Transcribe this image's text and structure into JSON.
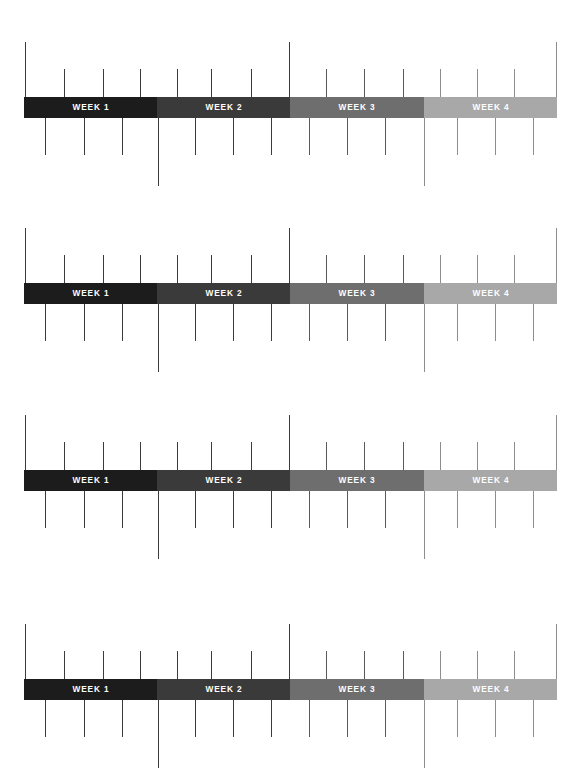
{
  "document": {
    "title": "Weekly Milestone Timeline Infographic",
    "type": "four-row week timeline with milestone leader lines",
    "background_color": "#ffffff",
    "width": 587,
    "height": 784
  },
  "week_labels": {
    "week_1": "WEEK 1",
    "week_2": "WEEK 2",
    "week_3": "WEEK 3",
    "week_4": "WEEK 4"
  },
  "palette": {
    "week_1": "#1c1c1c",
    "week_2": "#3a3a3a",
    "week_3": "#6e6e6e",
    "week_4": "#a8a8a8",
    "tick_dark": "#3b3b3b",
    "tick_mid": "#5a5a5a",
    "tick_light": "#8d8d8d",
    "label_text": "#ffffff"
  },
  "bar_geometry": {
    "left": 24,
    "width": 533,
    "height": 21,
    "segment_width": 133.25,
    "boundaries_x": [
      24,
      157,
      290,
      424,
      557
    ]
  },
  "segments": [
    {
      "key": "week_1",
      "label": "WEEK 1",
      "color": "#1c1c1c",
      "width": 133
    },
    {
      "key": "week_2",
      "label": "WEEK 2",
      "color": "#3a3a3a",
      "width": 133
    },
    {
      "key": "week_3",
      "label": "WEEK 3",
      "color": "#6e6e6e",
      "width": 134
    },
    {
      "key": "week_4",
      "label": "WEEK 4",
      "color": "#a8a8a8",
      "width": 133
    }
  ],
  "rows": [
    {
      "index": 1,
      "bar_top": 97
    },
    {
      "index": 2,
      "bar_top": 283
    },
    {
      "index": 3,
      "bar_top": 470
    },
    {
      "index": 4,
      "bar_top": 679
    }
  ],
  "ticks_above": [
    {
      "x": 25,
      "length": 55,
      "tone": "dark",
      "anchor": "row-start"
    },
    {
      "x": 64,
      "length": 28,
      "tone": "dark",
      "anchor": "milestone"
    },
    {
      "x": 103,
      "length": 28,
      "tone": "dark",
      "anchor": "milestone"
    },
    {
      "x": 140,
      "length": 28,
      "tone": "dark",
      "anchor": "milestone"
    },
    {
      "x": 177,
      "length": 28,
      "tone": "dark",
      "anchor": "milestone"
    },
    {
      "x": 211,
      "length": 28,
      "tone": "dark",
      "anchor": "milestone"
    },
    {
      "x": 251,
      "length": 28,
      "tone": "dark",
      "anchor": "milestone"
    },
    {
      "x": 289,
      "length": 55,
      "tone": "dark",
      "anchor": "week2-week3-boundary"
    },
    {
      "x": 326,
      "length": 28,
      "tone": "mid",
      "anchor": "milestone"
    },
    {
      "x": 364,
      "length": 28,
      "tone": "mid",
      "anchor": "milestone"
    },
    {
      "x": 403,
      "length": 28,
      "tone": "mid",
      "anchor": "milestone"
    },
    {
      "x": 440,
      "length": 28,
      "tone": "light",
      "anchor": "milestone"
    },
    {
      "x": 477,
      "length": 28,
      "tone": "light",
      "anchor": "milestone"
    },
    {
      "x": 514,
      "length": 28,
      "tone": "light",
      "anchor": "milestone"
    },
    {
      "x": 556,
      "length": 55,
      "tone": "light",
      "anchor": "row-end"
    }
  ],
  "ticks_below": [
    {
      "x": 45,
      "length": 37,
      "tone": "dark",
      "anchor": "milestone"
    },
    {
      "x": 84,
      "length": 37,
      "tone": "dark",
      "anchor": "milestone"
    },
    {
      "x": 122,
      "length": 37,
      "tone": "dark",
      "anchor": "milestone"
    },
    {
      "x": 158,
      "length": 68,
      "tone": "dark",
      "anchor": "week1-week2-boundary"
    },
    {
      "x": 195,
      "length": 37,
      "tone": "dark",
      "anchor": "milestone"
    },
    {
      "x": 233,
      "length": 37,
      "tone": "dark",
      "anchor": "milestone"
    },
    {
      "x": 271,
      "length": 37,
      "tone": "dark",
      "anchor": "milestone"
    },
    {
      "x": 309,
      "length": 37,
      "tone": "mid",
      "anchor": "milestone"
    },
    {
      "x": 347,
      "length": 37,
      "tone": "mid",
      "anchor": "milestone"
    },
    {
      "x": 385,
      "length": 37,
      "tone": "mid",
      "anchor": "milestone"
    },
    {
      "x": 424,
      "length": 68,
      "tone": "light",
      "anchor": "week3-week4-boundary"
    },
    {
      "x": 457,
      "length": 37,
      "tone": "light",
      "anchor": "milestone"
    },
    {
      "x": 495,
      "length": 37,
      "tone": "light",
      "anchor": "milestone"
    },
    {
      "x": 533,
      "length": 37,
      "tone": "light",
      "anchor": "milestone"
    }
  ]
}
